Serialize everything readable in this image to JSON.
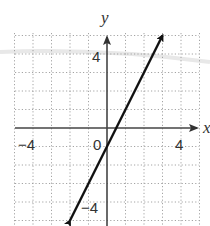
{
  "chart_data": {
    "type": "line",
    "title": "",
    "xlabel": "x",
    "ylabel": "y",
    "xlim": [
      -5,
      5
    ],
    "ylim": [
      -5,
      5
    ],
    "grid": true,
    "grid_style": "dotted",
    "tick_labels": {
      "x": [
        {
          "value": -4,
          "label": "−4"
        },
        {
          "value": 4,
          "label": "4"
        }
      ],
      "y": [
        {
          "value": 4,
          "label": "4"
        },
        {
          "value": -4,
          "label": "−4"
        }
      ],
      "origin": "0"
    },
    "series": [
      {
        "name": "y = 2x − 1",
        "equation": "y = 2x - 1",
        "slope": 2,
        "intercept": -1,
        "x": [
          -2,
          3
        ],
        "y": [
          -5,
          5
        ],
        "arrows": "both",
        "color": "#111111"
      }
    ]
  },
  "labels": {
    "x_axis": "x",
    "y_axis": "y",
    "origin": "0",
    "x_neg4": "−4",
    "x_pos4": "4",
    "y_pos4": "4",
    "y_neg4": "−4"
  }
}
